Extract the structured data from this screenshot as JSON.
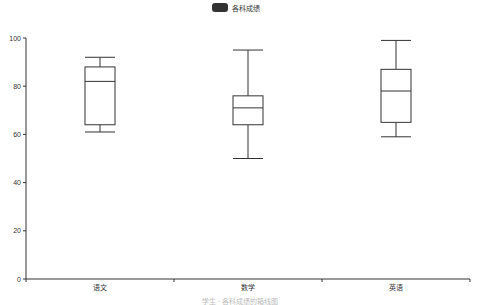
{
  "chart_data": {
    "type": "boxplot",
    "title": "",
    "legend": {
      "entries": [
        "各科成绩"
      ],
      "placement": "top-center",
      "color": "#333333"
    },
    "categories": [
      "语文",
      "数学",
      "英语"
    ],
    "series": [
      {
        "name": "各科成绩",
        "boxes": [
          {
            "category": "语文",
            "min": 61,
            "q1": 64,
            "median": 82,
            "q3": 88,
            "max": 92
          },
          {
            "category": "数学",
            "min": 50,
            "q1": 64,
            "median": 71,
            "q3": 76,
            "max": 95
          },
          {
            "category": "英语",
            "min": 59,
            "q1": 65,
            "median": 78,
            "q3": 87,
            "max": 99
          }
        ]
      }
    ],
    "xlabel": "",
    "ylabel": "",
    "ylim": [
      0,
      100
    ],
    "yticks": [
      0,
      20,
      40,
      60,
      80,
      100
    ],
    "grid": false,
    "caption": "学生 · 各科成绩的箱线图",
    "colors": {
      "box_stroke": "#333333",
      "axis": "#333333"
    }
  }
}
